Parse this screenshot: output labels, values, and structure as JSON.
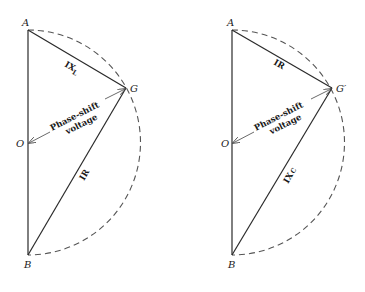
{
  "diagrams": [
    {
      "id": "inductive",
      "points": {
        "A": "A",
        "G": "G",
        "O": "O",
        "B": "B"
      },
      "segments": {
        "AG": {
          "main": "IX",
          "sub": "L"
        },
        "GB": {
          "main": "IR",
          "sub": ""
        }
      },
      "phase_label_line1": "Phase-shift",
      "phase_label_line2": "voltage"
    },
    {
      "id": "capacitive",
      "points": {
        "A": "A",
        "G": "G′",
        "O": "O",
        "B": "B"
      },
      "segments": {
        "AG": {
          "main": "IR",
          "sub": ""
        },
        "GB": {
          "main": "IX",
          "sub": "C"
        }
      },
      "phase_label_line1": "Phase-shift",
      "phase_label_line2": "voltage"
    }
  ]
}
